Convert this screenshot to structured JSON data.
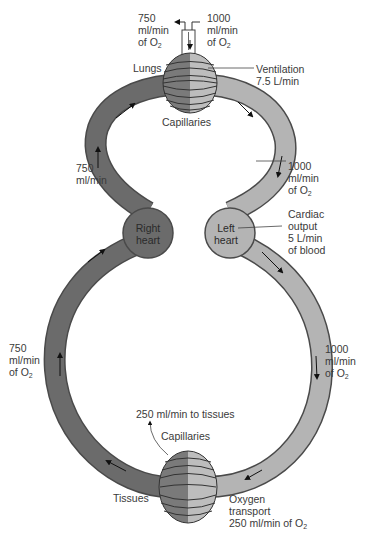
{
  "diagram": {
    "title": "",
    "colors": {
      "deoxygenated": "#6b6b6b",
      "oxygenated": "#b4b4b4",
      "outline": "#4a4a4a",
      "capillary_dark": "#7a7a7a",
      "capillary_light": "#bdbdbd",
      "text": "#3a3a3a"
    },
    "nodes": {
      "right_heart": {
        "line1": "Right",
        "line2": "heart"
      },
      "left_heart": {
        "line1": "Left",
        "line2": "heart"
      },
      "lungs": {
        "label": "Lungs",
        "capillaries": "Capillaries"
      },
      "tissues": {
        "label": "Tissues",
        "capillaries": "Capillaries"
      }
    },
    "labels": {
      "top_out": {
        "l1": "750",
        "l2": "ml/min",
        "l3": "of O",
        "sub": "2"
      },
      "top_in": {
        "l1": "1000",
        "l2": "ml/min",
        "l3": "of O",
        "sub": "2"
      },
      "ventilation": {
        "l1": "Ventilation",
        "l2": "7.5 L/min"
      },
      "pulm_artery": {
        "l1": "750",
        "l2": "ml/min"
      },
      "pulm_vein": {
        "l1": "1000",
        "l2": "ml/min",
        "l3": "of O",
        "sub": "2"
      },
      "cardiac_output": {
        "l1": "Cardiac",
        "l2": "output",
        "l3": "5 L/min",
        "l4": "of blood"
      },
      "venous_return": {
        "l1": "750",
        "l2": "ml/min",
        "l3": "of O",
        "sub": "2"
      },
      "arterial": {
        "l1": "1000",
        "l2": "ml/min",
        "l3": "of O",
        "sub": "2"
      },
      "to_tissues": "250 ml/min to tissues",
      "oxygen_transport": {
        "l1": "Oxygen",
        "l2": "transport",
        "l3": "250 ml/min of O",
        "sub": "2"
      }
    }
  }
}
